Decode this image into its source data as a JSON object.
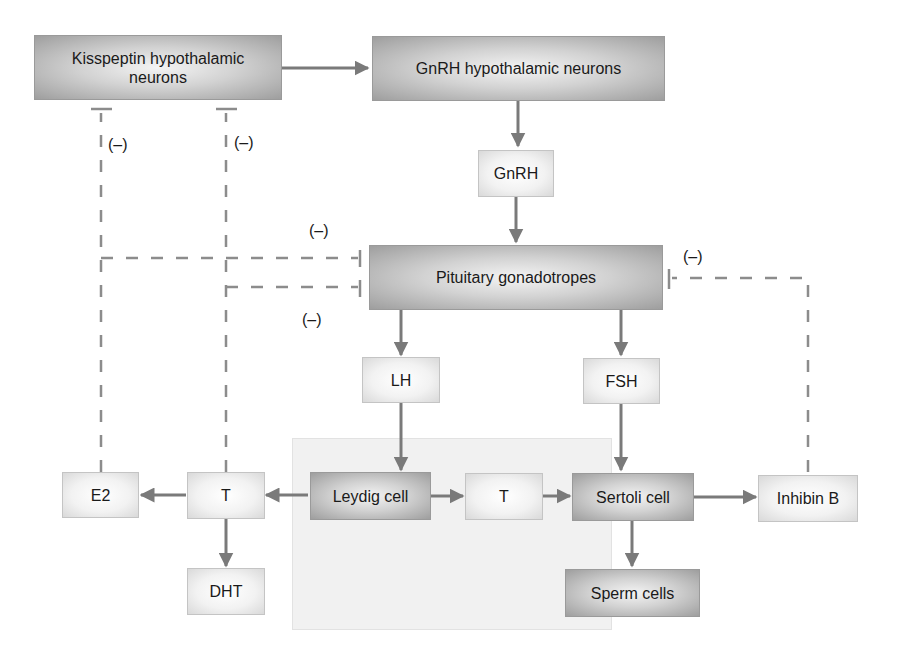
{
  "diagram": {
    "type": "flowchart",
    "nodes": {
      "kisspeptin": "Kisspeptin hypothalamic neurons",
      "gnrh_neurons": "GnRH hypothalamic neurons",
      "gnrh": "GnRH",
      "pituitary": "Pituitary gonadotropes",
      "lh": "LH",
      "fsh": "FSH",
      "leydig": "Leydig cell",
      "t_inner": "T",
      "sertoli": "Sertoli cell",
      "sperm": "Sperm cells",
      "inhibin": "Inhibin B",
      "t_outer": "T",
      "e2": "E2",
      "dht": "DHT"
    },
    "inhibition_label": "(–)",
    "edges": [
      {
        "from": "Kisspeptin hypothalamic neurons",
        "to": "GnRH hypothalamic neurons",
        "kind": "stimulatory"
      },
      {
        "from": "GnRH hypothalamic neurons",
        "to": "GnRH",
        "kind": "stimulatory"
      },
      {
        "from": "GnRH",
        "to": "Pituitary gonadotropes",
        "kind": "stimulatory"
      },
      {
        "from": "Pituitary gonadotropes",
        "to": "LH",
        "kind": "stimulatory"
      },
      {
        "from": "Pituitary gonadotropes",
        "to": "FSH",
        "kind": "stimulatory"
      },
      {
        "from": "LH",
        "to": "Leydig cell",
        "kind": "stimulatory"
      },
      {
        "from": "FSH",
        "to": "Sertoli cell",
        "kind": "stimulatory"
      },
      {
        "from": "Leydig cell",
        "to": "T (inner)",
        "kind": "stimulatory"
      },
      {
        "from": "T (inner)",
        "to": "Sertoli cell",
        "kind": "stimulatory"
      },
      {
        "from": "Leydig cell",
        "to": "T (outer)",
        "kind": "stimulatory"
      },
      {
        "from": "T (outer)",
        "to": "E2",
        "kind": "stimulatory"
      },
      {
        "from": "T (outer)",
        "to": "DHT",
        "kind": "stimulatory"
      },
      {
        "from": "Sertoli cell",
        "to": "Sperm cells",
        "kind": "stimulatory"
      },
      {
        "from": "Sertoli cell",
        "to": "Inhibin B",
        "kind": "stimulatory"
      },
      {
        "from": "E2",
        "to": "Kisspeptin hypothalamic neurons",
        "kind": "inhibitory",
        "label": "(–)"
      },
      {
        "from": "T (outer)",
        "to": "Kisspeptin hypothalamic neurons",
        "kind": "inhibitory",
        "label": "(–)"
      },
      {
        "from": "E2",
        "to": "Pituitary gonadotropes",
        "kind": "inhibitory",
        "label": "(–)"
      },
      {
        "from": "T (outer)",
        "to": "Pituitary gonadotropes",
        "kind": "inhibitory",
        "label": "(–)"
      },
      {
        "from": "Inhibin B",
        "to": "Pituitary gonadotropes",
        "kind": "inhibitory",
        "label": "(–)"
      }
    ],
    "colors": {
      "arrow": "#7a7a7a",
      "dashed_line": "#8c8c8c",
      "dark_box_edge": "#9e9e9e",
      "light_box_edge": "#d9d9d9",
      "testis_region": "#f1f1f1"
    }
  }
}
